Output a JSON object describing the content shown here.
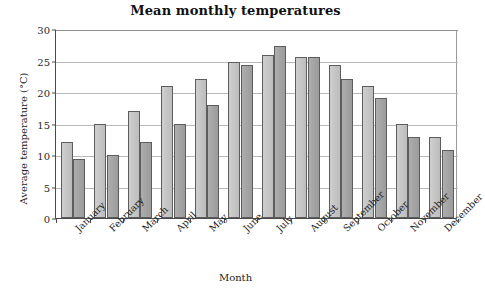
{
  "chart_data": {
    "type": "bar",
    "title": "Mean monthly temperatures",
    "xlabel": "Month",
    "ylabel": "Average temperature (°C)",
    "categories": [
      "January",
      "February",
      "March",
      "April",
      "May",
      "June",
      "July",
      "August",
      "September",
      "October",
      "November",
      "December"
    ],
    "series": [
      {
        "name": "series-a",
        "color": "#c6c6c6",
        "values": [
          12,
          15,
          17,
          21,
          22,
          24.8,
          25.8,
          25.5,
          24.3,
          21,
          15,
          12.8
        ]
      },
      {
        "name": "series-b",
        "color": "#a5a5a5",
        "values": [
          9.3,
          10,
          12,
          15,
          18,
          24.3,
          27.3,
          25.6,
          22,
          19,
          12.8,
          10.8
        ]
      }
    ],
    "ylim": [
      0,
      30
    ],
    "yticks": [
      0,
      5,
      10,
      15,
      20,
      25,
      30
    ],
    "ytick_labels": [
      "0",
      "5",
      "10",
      "15",
      "20",
      "25",
      "30"
    ],
    "grid": "horizontal",
    "legend": "none",
    "axis_color": "#4a4a4a",
    "grid_color": "#b9b9b9"
  }
}
